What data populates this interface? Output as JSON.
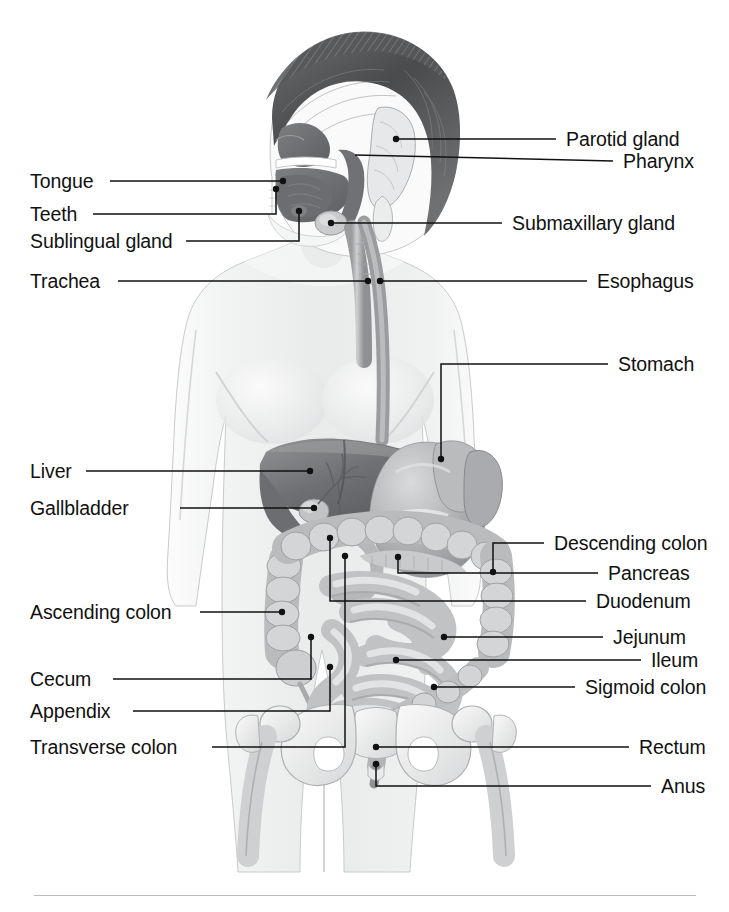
{
  "figure": {
    "background_color": "#ffffff",
    "ink_color": "#111111",
    "rule_color": "#b9bcbe"
  },
  "labels": {
    "parotid_gland": "Parotid gland",
    "pharynx": "Pharynx",
    "tongue": "Tongue",
    "teeth": "Teeth",
    "sublingual_gland": "Sublingual gland",
    "submaxillary_gland": "Submaxillary gland",
    "trachea": "Trachea",
    "esophagus": "Esophagus",
    "stomach": "Stomach",
    "liver": "Liver",
    "gallbladder": "Gallbladder",
    "descending_colon": "Descending colon",
    "pancreas": "Pancreas",
    "duodenum": "Duodenum",
    "ascending_colon": "Ascending colon",
    "jejunum": "Jejunum",
    "ileum": "Ileum",
    "cecum": "Cecum",
    "sigmoid_colon": "Sigmoid colon",
    "appendix": "Appendix",
    "transverse_colon": "Transverse colon",
    "rectum": "Rectum",
    "anus": "Anus"
  },
  "label_layout": [
    {
      "key": "parotid_gland",
      "side": "right",
      "x": 566,
      "y": 130
    },
    {
      "key": "pharynx",
      "side": "right",
      "x": 623,
      "y": 152
    },
    {
      "key": "tongue",
      "side": "left",
      "x": 30,
      "y": 172
    },
    {
      "key": "teeth",
      "side": "left",
      "x": 30,
      "y": 205
    },
    {
      "key": "sublingual_gland",
      "side": "left",
      "x": 30,
      "y": 232
    },
    {
      "key": "submaxillary_gland",
      "side": "right",
      "x": 512,
      "y": 214
    },
    {
      "key": "trachea",
      "side": "left",
      "x": 30,
      "y": 272
    },
    {
      "key": "esophagus",
      "side": "right",
      "x": 597,
      "y": 272
    },
    {
      "key": "stomach",
      "side": "right",
      "x": 618,
      "y": 355
    },
    {
      "key": "liver",
      "side": "left",
      "x": 30,
      "y": 462
    },
    {
      "key": "gallbladder",
      "side": "left",
      "x": 30,
      "y": 499
    },
    {
      "key": "descending_colon",
      "side": "right",
      "x": 554,
      "y": 534
    },
    {
      "key": "pancreas",
      "side": "right",
      "x": 608,
      "y": 564
    },
    {
      "key": "duodenum",
      "side": "right",
      "x": 596,
      "y": 592
    },
    {
      "key": "ascending_colon",
      "side": "left",
      "x": 30,
      "y": 603
    },
    {
      "key": "jejunum",
      "side": "right",
      "x": 613,
      "y": 628
    },
    {
      "key": "ileum",
      "side": "right",
      "x": 651,
      "y": 651
    },
    {
      "key": "cecum",
      "side": "left",
      "x": 30,
      "y": 670
    },
    {
      "key": "sigmoid_colon",
      "side": "right",
      "x": 585,
      "y": 678
    },
    {
      "key": "appendix",
      "side": "left",
      "x": 30,
      "y": 702
    },
    {
      "key": "transverse_colon",
      "side": "left",
      "x": 30,
      "y": 738
    },
    {
      "key": "rectum",
      "side": "right",
      "x": 639,
      "y": 738
    },
    {
      "key": "anus",
      "side": "right",
      "x": 661,
      "y": 777
    }
  ],
  "leader_lines": [
    {
      "key": "parotid_gland",
      "path": "M556,139 L396,139",
      "dot": [
        396,
        139
      ]
    },
    {
      "key": "pharynx",
      "path": "M613,161 L355,155",
      "dot": null
    },
    {
      "key": "tongue",
      "path": "M110,181 L283,181",
      "dot": [
        283,
        181
      ]
    },
    {
      "key": "teeth",
      "path": "M93,214 L276,214 L276,189",
      "dot": [
        276,
        189
      ]
    },
    {
      "key": "sublingual_gland",
      "path": "M186,241 L299,241 L299,211",
      "dot": [
        299,
        211
      ]
    },
    {
      "key": "submaxillary_gland",
      "path": "M502,223 L331,223",
      "dot": [
        331,
        223
      ]
    },
    {
      "key": "trachea",
      "path": "M118,281 L368,281",
      "dot": [
        368,
        281
      ]
    },
    {
      "key": "esophagus",
      "path": "M587,281 L380,281",
      "dot": [
        380,
        281
      ]
    },
    {
      "key": "stomach",
      "path": "M608,364 L441,364 L441,459",
      "dot": [
        441,
        459
      ]
    },
    {
      "key": "liver",
      "path": "M86,471 L310,471",
      "dot": [
        310,
        471
      ]
    },
    {
      "key": "gallbladder",
      "path": "M180,508 L314,508",
      "dot": [
        314,
        508
      ]
    },
    {
      "key": "descending_colon",
      "path": "M544,543 L493,543 L493,572",
      "dot": [
        493,
        572
      ]
    },
    {
      "key": "pancreas",
      "path": "M598,573 L398,573 L398,557",
      "dot": [
        398,
        557
      ]
    },
    {
      "key": "duodenum",
      "path": "M586,601 L330,601 L330,538",
      "dot": [
        330,
        538
      ]
    },
    {
      "key": "ascending_colon",
      "path": "M200,612 L282,612",
      "dot": [
        282,
        612
      ]
    },
    {
      "key": "jejunum",
      "path": "M603,637 L444,637",
      "dot": [
        444,
        637
      ]
    },
    {
      "key": "ileum",
      "path": "M641,660 L396,660",
      "dot": [
        396,
        660
      ]
    },
    {
      "key": "cecum",
      "path": "M113,679 L311,679 L311,637",
      "dot": [
        311,
        637
      ]
    },
    {
      "key": "sigmoid_colon",
      "path": "M575,687 L434,687",
      "dot": [
        434,
        687
      ]
    },
    {
      "key": "appendix",
      "path": "M133,711 L330,711 L330,667",
      "dot": [
        330,
        667
      ]
    },
    {
      "key": "transverse_colon",
      "path": "M212,747 L345,747 L345,556",
      "dot": [
        345,
        556
      ]
    },
    {
      "key": "rectum",
      "path": "M629,747 L376,747",
      "dot": [
        376,
        747
      ]
    },
    {
      "key": "anus",
      "path": "M651,786 L376,786 L376,764",
      "dot": [
        376,
        764
      ]
    }
  ]
}
